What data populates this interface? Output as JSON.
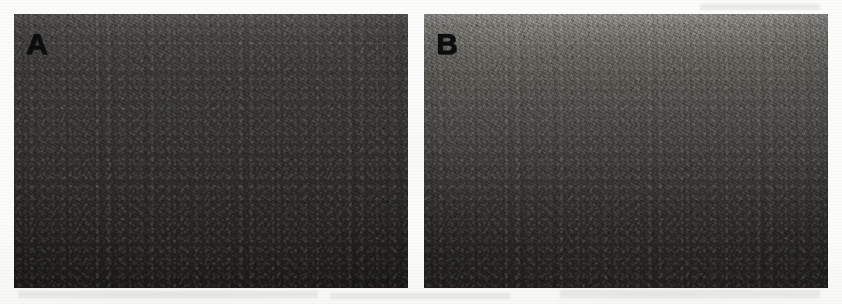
{
  "figure": {
    "background_color": "#fbfbf9",
    "width": 842,
    "height": 304,
    "panels": [
      {
        "label": "A",
        "name": "panel-a",
        "x": 14,
        "y": 14,
        "width": 394,
        "height": 274,
        "label_x": 26,
        "label_y": 29,
        "gradient_top_color": "#53524f",
        "gradient_mid_color": "#343330",
        "gradient_bottom_color": "#1d1c1a",
        "mean_gray": "#333230",
        "description": "Dark noisy grayscale field, slightly lighter at the top edge, darkening toward the bottom"
      },
      {
        "label": "B",
        "name": "panel-b",
        "x": 424,
        "y": 14,
        "width": 404,
        "height": 274,
        "label_x": 436,
        "label_y": 29,
        "gradient_top_color": "#8a8985",
        "gradient_mid_color": "#4a4946",
        "gradient_bottom_color": "#232220",
        "mean_gray": "#4b4a47",
        "description": "Noisy grayscale field, noticeably lighter at the top and fading to near-black at the bottom"
      }
    ],
    "gutter": {
      "name": "panel-gutter",
      "x": 408,
      "width": 16,
      "color": "#fdfdfb"
    }
  }
}
